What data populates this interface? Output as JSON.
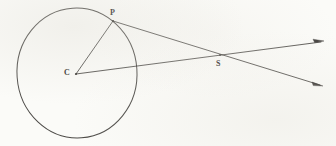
{
  "figure": {
    "kind": "geometry-diagram",
    "background_color": "#fbfbf8",
    "ink_color": "#2e2b28",
    "canvas": {
      "width": 336,
      "height": 146
    },
    "circle": {
      "label": "circle",
      "center_x": 77,
      "center_y": 73,
      "radius_x": 60,
      "radius_y": 65,
      "rotation_deg": -4,
      "stroke_width": 1.0
    },
    "points": [
      {
        "id": "P",
        "label": "P",
        "x": 113,
        "y": 21,
        "label_x": 110,
        "label_y": 9
      },
      {
        "id": "C",
        "label": "C",
        "x": 76,
        "y": 74,
        "label_x": 64,
        "label_y": 69
      },
      {
        "id": "S",
        "label": "S",
        "x": 220,
        "y": 55,
        "label_x": 216,
        "label_y": 60
      }
    ],
    "segments": [
      {
        "id": "C-P",
        "from": "C",
        "to": "P",
        "x1": 76,
        "y1": 74,
        "x2": 113,
        "y2": 21,
        "arrow": false
      },
      {
        "id": "P-S-ray",
        "from": "P",
        "through": "S",
        "x1": 113,
        "y1": 21,
        "x2": 323,
        "y2": 86,
        "arrow": true
      },
      {
        "id": "C-S-ray",
        "from": "C",
        "through": "S",
        "x1": 76,
        "y1": 74,
        "x2": 324,
        "y2": 41,
        "arrow": true
      }
    ],
    "arrowheads": [
      {
        "id": "upper-right-arrowhead",
        "tip_x": 324,
        "tip_y": 41
      },
      {
        "id": "lower-right-arrowhead",
        "tip_x": 323,
        "tip_y": 86
      }
    ]
  }
}
